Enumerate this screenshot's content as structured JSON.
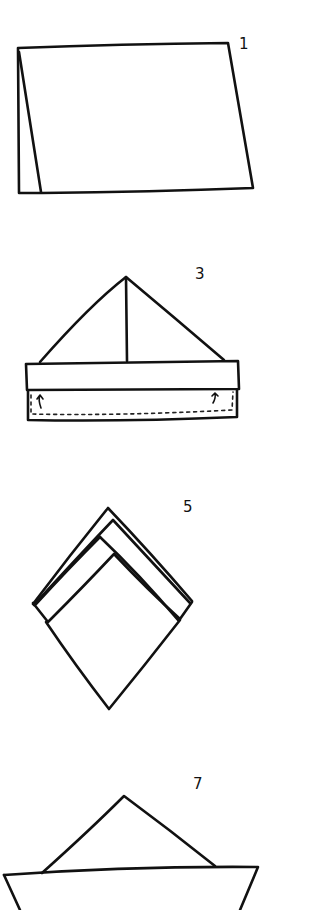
{
  "diagram": {
    "type": "paper-boat folding instructions",
    "background": "#ffffff",
    "ink_color": "#111111",
    "steps": [
      {
        "number": "1",
        "label_pos": [
          241,
          38
        ],
        "description": "paper folded in half, standing like a tent card"
      },
      {
        "number": "3",
        "label_pos": [
          195,
          268
        ],
        "description": "triangle hat shape with folded-up bottom band; arrows indicate folding the lower flap up"
      },
      {
        "number": "5",
        "label_pos": [
          184,
          500
        ],
        "description": "hat opened and flattened into a diamond / square"
      },
      {
        "number": "7",
        "label_pos": [
          193,
          777
        ],
        "description": "finished paper boat with sail on top of hull"
      }
    ]
  }
}
